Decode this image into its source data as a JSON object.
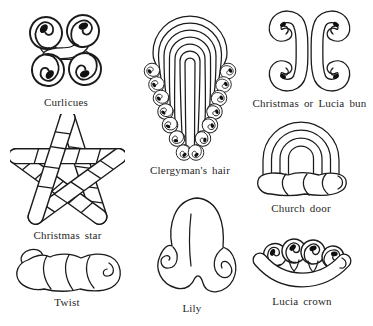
{
  "colors": {
    "ink": "#1b1b1b",
    "paper": "#ffffff"
  },
  "figures": [
    {
      "id": "curlicues",
      "label": "Curlicues"
    },
    {
      "id": "clergymans-hair",
      "label": "Clergyman's hair"
    },
    {
      "id": "christmas-or-lucia-bun",
      "label": "Christmas or Lucia bun"
    },
    {
      "id": "christmas-star",
      "label": "Christmas star"
    },
    {
      "id": "church-door",
      "label": "Church door"
    },
    {
      "id": "twist",
      "label": "Twist"
    },
    {
      "id": "lily",
      "label": "Lily"
    },
    {
      "id": "lucia-crown",
      "label": "Lucia crown"
    }
  ]
}
